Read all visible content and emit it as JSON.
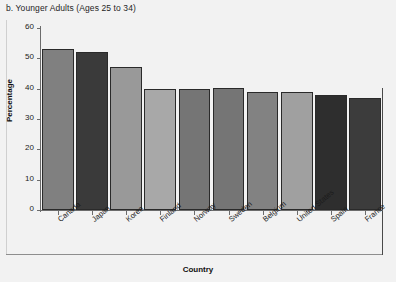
{
  "chart_data": {
    "type": "bar",
    "title": "b. Younger Adults (Ages 25 to 34)",
    "xlabel": "Country",
    "ylabel": "Percentage",
    "ylim": [
      0,
      60
    ],
    "yticks": [
      0,
      10,
      20,
      30,
      40,
      50,
      60
    ],
    "grid": false,
    "legend": "none",
    "categories": [
      "Canada",
      "Japan",
      "Korea",
      "Finland",
      "Norway",
      "Sweden",
      "Belgium",
      "United States",
      "Spain",
      "France"
    ],
    "values": [
      53,
      52,
      47,
      40,
      40,
      40.2,
      39,
      39,
      38,
      37
    ],
    "bar_colors": [
      "#808080",
      "#3a3a3a",
      "#999999",
      "#a8a8a8",
      "#757575",
      "#757575",
      "#828282",
      "#a0a0a0",
      "#2e2e2e",
      "#3c3c3c"
    ],
    "bar_border_color": "#2a2a2a"
  },
  "axes": {
    "y_label": "Percentage",
    "x_label": "Country",
    "y_tick_labels": [
      "60",
      "50",
      "40",
      "30",
      "20",
      "10",
      "0"
    ]
  },
  "figure": {
    "title": "b. Younger Adults (Ages 25 to 34)",
    "background": "#f2f2f2",
    "axis_color": "#6c6c6c"
  }
}
